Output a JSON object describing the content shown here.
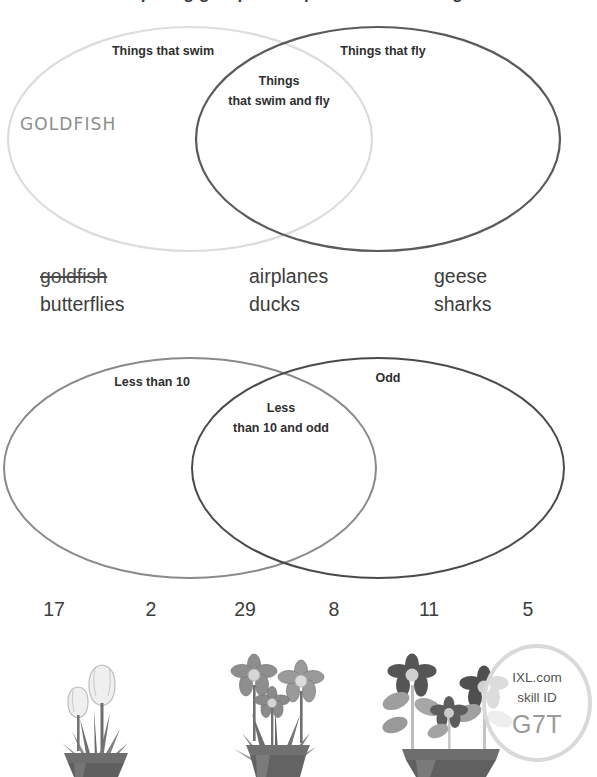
{
  "page": {
    "clipped_title": "Comparing groups: complete the Venn diagram",
    "background_color": "#ffffff",
    "text_color": "#3c3c3c"
  },
  "venn1": {
    "left_label": "Things that swim",
    "right_label": "Things that fly",
    "center_label_line1": "Things",
    "center_label_line2": "that swim and fly",
    "left_circle_color": "#dcdcdc",
    "right_circle_color": "#5a5a5a",
    "answer_left": "GOLDFISH",
    "answer_color": "#8d8d8d"
  },
  "word_bank": {
    "columns": [
      {
        "words": [
          {
            "text": "goldfish",
            "used": true
          },
          {
            "text": "butterflies",
            "used": false
          }
        ]
      },
      {
        "words": [
          {
            "text": "airplanes",
            "used": false
          },
          {
            "text": "ducks",
            "used": false
          }
        ]
      },
      {
        "words": [
          {
            "text": "geese",
            "used": false
          },
          {
            "text": "sharks",
            "used": false
          }
        ]
      }
    ]
  },
  "venn2": {
    "left_label": "Less than 10",
    "right_label": "Odd",
    "center_label_line1": "Less",
    "center_label_line2": "than 10 and odd",
    "left_circle_color": "#8a8a8a",
    "right_circle_color": "#4a4a4a"
  },
  "number_bank": {
    "numbers": [
      "17",
      "2",
      "29",
      "8",
      "11",
      "5"
    ]
  },
  "illustration": {
    "pots": [
      {
        "name": "tulip-pot",
        "flower_count": 2,
        "flower_type": "tulip"
      },
      {
        "name": "daisy-pot",
        "flower_count": 3,
        "flower_type": "daisy"
      },
      {
        "name": "dark-daisy-pot",
        "flower_count": 3,
        "flower_type": "daisy"
      }
    ]
  },
  "badge": {
    "line1": "IXL.com",
    "line2": "skill ID",
    "code": "G7T",
    "ring_color": "#d9d9d9",
    "code_color": "#9a9a9a"
  }
}
